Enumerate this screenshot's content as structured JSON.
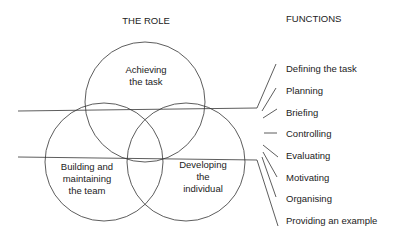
{
  "diagram": {
    "role_heading": "THE ROLE",
    "functions_heading": "FUNCTIONS",
    "circles": [
      {
        "id": "task",
        "lines": [
          "Achieving",
          "the task"
        ]
      },
      {
        "id": "team",
        "lines": [
          "Building and",
          "maintaining",
          "the team"
        ]
      },
      {
        "id": "individual",
        "lines": [
          "Developing",
          "the",
          "individual"
        ]
      }
    ],
    "functions": [
      "Defining the task",
      "Planning",
      "Briefing",
      "Controlling",
      "Evaluating",
      "Motivating",
      "Organising",
      "Providing an example"
    ],
    "colors": {
      "line": "#333333",
      "text": "#222222",
      "background": "#ffffff"
    }
  }
}
